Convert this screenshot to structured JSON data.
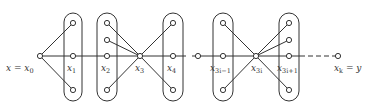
{
  "diagram": {
    "colors": {
      "stroke": "#333333",
      "background": "#ffffff",
      "label": "#333333"
    },
    "main_line": {
      "y": 56,
      "x_start": 40,
      "x_solid_end": 300,
      "x_dashed_end": 338,
      "gap_at": 189
    },
    "labels": [
      {
        "id": "x0",
        "text": "x = x",
        "sub": "0",
        "x": 6,
        "y": 71
      },
      {
        "id": "x1",
        "text": "x",
        "sub": "1",
        "x": 67,
        "y": 71
      },
      {
        "id": "x2",
        "text": "x",
        "sub": "2",
        "x": 101,
        "y": 71
      },
      {
        "id": "x3",
        "text": "x",
        "sub": "3",
        "x": 135,
        "y": 71
      },
      {
        "id": "x4",
        "text": "x",
        "sub": "4",
        "x": 167,
        "y": 71
      },
      {
        "id": "x3i-1",
        "text": "x",
        "sub": "3i−1",
        "x": 210,
        "y": 71
      },
      {
        "id": "x3i",
        "text": "x",
        "sub": "3i",
        "x": 251,
        "y": 71
      },
      {
        "id": "x3i+1",
        "text": "x",
        "sub": "3i+1",
        "x": 277,
        "y": 71
      },
      {
        "id": "xk",
        "text": "x",
        "sub": "k",
        "suffix": " = y",
        "x": 334,
        "y": 71
      }
    ],
    "groups": [
      {
        "id": "group-x1",
        "x": 64,
        "y": 13,
        "w": 18,
        "h": 88
      },
      {
        "id": "group-x2",
        "x": 97,
        "y": 13,
        "w": 20,
        "h": 88
      },
      {
        "id": "group-x4",
        "x": 163,
        "y": 13,
        "w": 20,
        "h": 88
      },
      {
        "id": "group-x3i-1",
        "x": 213,
        "y": 13,
        "w": 20,
        "h": 88
      },
      {
        "id": "group-x3i+1",
        "x": 279,
        "y": 13,
        "w": 20,
        "h": 88
      }
    ],
    "vertices": [
      {
        "id": "x0",
        "x": 40,
        "y": 56
      },
      {
        "id": "x1-top",
        "x": 73,
        "y": 23
      },
      {
        "id": "x1",
        "x": 73,
        "y": 56
      },
      {
        "id": "x1-bottom",
        "x": 73,
        "y": 90
      },
      {
        "id": "x2-top",
        "x": 107,
        "y": 23
      },
      {
        "id": "x2-upper",
        "x": 107,
        "y": 40
      },
      {
        "id": "x2",
        "x": 107,
        "y": 56
      },
      {
        "id": "x2-bottom",
        "x": 107,
        "y": 90
      },
      {
        "id": "x3",
        "x": 140,
        "y": 56
      },
      {
        "id": "x4-top",
        "x": 173,
        "y": 23
      },
      {
        "id": "x4",
        "x": 173,
        "y": 56
      },
      {
        "id": "x4-bottom",
        "x": 173,
        "y": 90
      },
      {
        "id": "mid",
        "x": 198,
        "y": 56
      },
      {
        "id": "x3i-1-top",
        "x": 223,
        "y": 23
      },
      {
        "id": "x3i-1",
        "x": 223,
        "y": 56
      },
      {
        "id": "x3i-1-bottom",
        "x": 223,
        "y": 90
      },
      {
        "id": "x3i",
        "x": 256,
        "y": 56
      },
      {
        "id": "x3i+1-top",
        "x": 289,
        "y": 23
      },
      {
        "id": "x3i+1-upper",
        "x": 289,
        "y": 40
      },
      {
        "id": "x3i+1",
        "x": 289,
        "y": 56
      },
      {
        "id": "x3i+1-bottom",
        "x": 289,
        "y": 90
      },
      {
        "id": "xk",
        "x": 338,
        "y": 56
      }
    ],
    "edges": [
      [
        40,
        56,
        73,
        23
      ],
      [
        40,
        56,
        73,
        90
      ],
      [
        140,
        56,
        107,
        23
      ],
      [
        140,
        56,
        107,
        40
      ],
      [
        140,
        56,
        107,
        90
      ],
      [
        140,
        56,
        173,
        23
      ],
      [
        140,
        56,
        173,
        90
      ],
      [
        256,
        56,
        223,
        23
      ],
      [
        256,
        56,
        223,
        90
      ],
      [
        256,
        56,
        289,
        23
      ],
      [
        256,
        56,
        289,
        40
      ],
      [
        256,
        56,
        289,
        90
      ]
    ]
  }
}
